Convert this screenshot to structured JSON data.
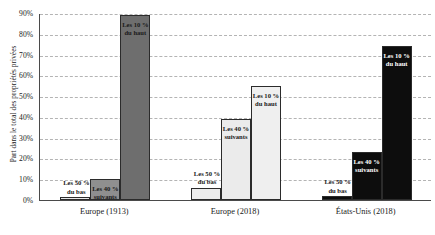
{
  "chart_data": {
    "type": "bar",
    "title": "",
    "xlabel": "",
    "ylabel": "Part dans le total des propriétés privées",
    "ylim": [
      0,
      90
    ],
    "grid": true,
    "legend": "none",
    "ytick_labels": [
      "90%",
      "80%",
      "70%",
      "60%",
      "50%",
      "40%",
      "30%",
      "20%",
      "10%",
      "0%"
    ],
    "ytick_values": [
      90,
      80,
      70,
      60,
      50,
      40,
      30,
      20,
      10,
      0
    ],
    "categories": [
      "Europe (1913)",
      "Europe (2018)",
      "États-Unis (2018)"
    ],
    "series": [
      {
        "name": "Les 50 %\ndu bas",
        "values": [
          1.5,
          6,
          2
        ]
      },
      {
        "name": "Les 40 %\nsuivants",
        "values": [
          10,
          39,
          23
        ]
      },
      {
        "name": "Les 10 %\ndu haut",
        "values": [
          89,
          55,
          74
        ]
      }
    ],
    "bars": [
      {
        "group": "Europe (1913)",
        "label": "Les 50 %\ndu bas",
        "value": 1.5,
        "fill": "#e8e8e8",
        "text": "#1a1a1a",
        "label_pos": "above"
      },
      {
        "group": "Europe (1913)",
        "label": "Les 40 %\nsuivants",
        "value": 10,
        "fill": "#8f8f8f",
        "text": "#1a1a1a",
        "label_pos": "inside"
      },
      {
        "group": "Europe (1913)",
        "label": "Les 10 %\ndu haut",
        "value": 89,
        "fill": "#6e6e6e",
        "text": "#1a1a1a",
        "label_pos": "inside"
      },
      {
        "group": "Europe (2018)",
        "label": "Les 50 %\ndu bas",
        "value": 6,
        "fill": "#ececec",
        "text": "#1a1a1a",
        "label_pos": "above"
      },
      {
        "group": "Europe (2018)",
        "label": "Les 40 %\nsuivants",
        "value": 39,
        "fill": "#ebebeb",
        "text": "#1a1a1a",
        "label_pos": "inside"
      },
      {
        "group": "Europe (2018)",
        "label": "Les 10 %\ndu haut",
        "value": 55,
        "fill": "#efefef",
        "text": "#1a1a1a",
        "label_pos": "inside"
      },
      {
        "group": "États-Unis (2018)",
        "label": "Les 50 %\ndu bas",
        "value": 2,
        "fill": "#0d0d0d",
        "text": "#1a1a1a",
        "label_pos": "above"
      },
      {
        "group": "États-Unis (2018)",
        "label": "Les 40 %\nsuivants",
        "value": 23,
        "fill": "#0d0d0d",
        "text": "#ffffff",
        "label_pos": "inside"
      },
      {
        "group": "États-Unis (2018)",
        "label": "Les 10 %\ndu haut",
        "value": 74,
        "fill": "#0d0d0d",
        "text": "#ffffff",
        "label_pos": "inside"
      }
    ],
    "colors": {
      "axis": "#4a4a4a",
      "grid": "#b4b4b4",
      "background": "#ffffff",
      "bar_border": "#2b2b2b"
    }
  }
}
